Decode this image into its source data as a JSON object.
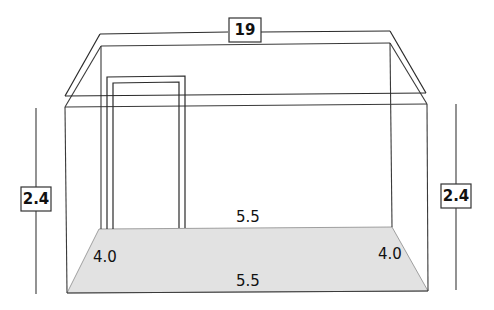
{
  "diagram": {
    "labels": {
      "roof_perimeter": "19",
      "left_height": "2.4",
      "right_height": "2.4",
      "back_length": "5.5",
      "front_length": "5.5",
      "left_width": "4.0",
      "right_width": "4.0"
    },
    "colors": {
      "floor_fill": "#e2e2e2",
      "line": "#3a3a3a",
      "background": "#ffffff"
    }
  }
}
